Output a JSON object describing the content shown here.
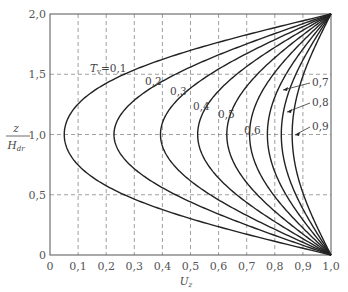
{
  "chart_data": {
    "type": "line",
    "title": "",
    "xlabel": "U_z",
    "ylabel": "z / H_dr",
    "xlim": [
      0,
      1.0
    ],
    "ylim": [
      0,
      2.0
    ],
    "grid": true,
    "x_ticks": [
      "0",
      "0.1",
      "0.2",
      "0.3",
      "0.4",
      "0.5",
      "0.6",
      "0.7",
      "0.8",
      "0.9",
      "1.0"
    ],
    "y_ticks": [
      "0",
      "0.5",
      "1.0",
      "1.5",
      "2.0"
    ],
    "series": [
      {
        "name": "T_v=0.1",
        "Tv": 0.1,
        "min_U_at_z1": 0.05
      },
      {
        "name": "0.2",
        "Tv": 0.2,
        "min_U_at_z1": 0.24
      },
      {
        "name": "0.3",
        "Tv": 0.3,
        "min_U_at_z1": 0.39
      },
      {
        "name": "0.4",
        "Tv": 0.4,
        "min_U_at_z1": 0.52
      },
      {
        "name": "0.5",
        "Tv": 0.5,
        "min_U_at_z1": 0.62
      },
      {
        "name": "0.6",
        "Tv": 0.6,
        "min_U_at_z1": 0.7
      },
      {
        "name": "0.7",
        "Tv": 0.7,
        "min_U_at_z1": 0.77
      },
      {
        "name": "0.8",
        "Tv": 0.8,
        "min_U_at_z1": 0.82
      },
      {
        "name": "0.9",
        "Tv": 0.9,
        "min_U_at_z1": 0.86
      }
    ],
    "annotations": [
      {
        "text": "T_v=0.1"
      },
      {
        "text": "0.2"
      },
      {
        "text": "0.3"
      },
      {
        "text": "0.4"
      },
      {
        "text": "0.5"
      },
      {
        "text": "0.6"
      },
      {
        "text": "0.7"
      },
      {
        "text": "0.8"
      },
      {
        "text": "0.9"
      }
    ]
  }
}
